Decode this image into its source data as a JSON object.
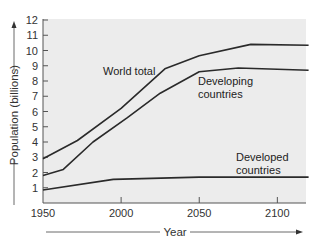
{
  "chart_data": {
    "type": "line",
    "title": "",
    "xlabel": "Year",
    "ylabel": "Population (billions)",
    "xlim": [
      1950,
      2120
    ],
    "ylim": [
      0,
      12
    ],
    "x_ticks": [
      1950,
      2000,
      2050,
      2100
    ],
    "y_ticks": [
      1,
      2,
      3,
      4,
      5,
      6,
      7,
      8,
      9,
      10,
      11,
      12
    ],
    "grid": false,
    "legend": "inline annotations",
    "series": [
      {
        "name": "World total",
        "label_lines": [
          "World total"
        ],
        "label_pos": [
          103,
          75
        ],
        "points": [
          [
            1950,
            2.9
          ],
          [
            1972,
            4.1
          ],
          [
            2000,
            6.2
          ],
          [
            2028,
            8.8
          ],
          [
            2050,
            9.65
          ],
          [
            2083,
            10.4
          ],
          [
            2120,
            10.35
          ]
        ]
      },
      {
        "name": "Developing countries",
        "label_lines": [
          "Developing",
          "countries"
        ],
        "label_pos": [
          198,
          85
        ],
        "points": [
          [
            1950,
            1.8
          ],
          [
            1963,
            2.2
          ],
          [
            1982,
            4.0
          ],
          [
            2004,
            5.6
          ],
          [
            2025,
            7.2
          ],
          [
            2050,
            8.6
          ],
          [
            2075,
            8.85
          ],
          [
            2120,
            8.7
          ]
        ]
      },
      {
        "name": "Developed countries",
        "label_lines": [
          "Developed",
          "countries"
        ],
        "label_pos": [
          236,
          161
        ],
        "points": [
          [
            1950,
            0.85
          ],
          [
            1995,
            1.55
          ],
          [
            2050,
            1.7
          ],
          [
            2120,
            1.7
          ]
        ]
      }
    ],
    "colors": {
      "line": "#2a2a2a",
      "plot_background": "#ececec",
      "axis": "#555555",
      "arrow": "#333333"
    }
  }
}
